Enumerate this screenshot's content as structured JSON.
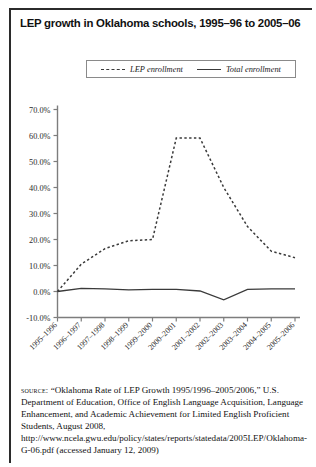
{
  "figure": {
    "title": "LEP growth in Oklahoma schools, 1995–96 to 2005–06",
    "source_label": "source:",
    "source_text": " “Oklahoma Rate of LEP Growth 1995/1996–2005/2006,” U.S. Department of Education, Office of English Language Acquisition, Language Enhancement, and Academic Achievement for Limited English Proficient Students, August 2008, http://www.ncela.gwu.edu/policy/states/reports/statedata/2005LEP/Oklahoma-G-06.pdf (accessed January 12, 2009)"
  },
  "legend": {
    "entries": [
      {
        "label": "LEP enrollment",
        "style": "dashed",
        "color": "#3a3a3a"
      },
      {
        "label": "Total enrollment",
        "style": "solid",
        "color": "#3a3a3a"
      }
    ]
  },
  "chart_data": {
    "type": "line",
    "title": "LEP growth in Oklahoma schools, 1995–96 to 2005–06",
    "xlabel": "",
    "ylabel": "",
    "categories": [
      "1995–1996",
      "1996–1997",
      "1997–1998",
      "1998–1999",
      "1999–2000",
      "2000–2001",
      "2001–2002",
      "2002–2003",
      "2003–2004",
      "2004–2005",
      "2005–2006"
    ],
    "ylim": [
      -10,
      70
    ],
    "yticks": [
      -10,
      0,
      10,
      20,
      30,
      40,
      50,
      60,
      70
    ],
    "ytick_labels": [
      "-10.0%",
      "0.0%",
      "10.0%",
      "20.0%",
      "30.0%",
      "40.0%",
      "50.0%",
      "60.0%",
      "70.0%"
    ],
    "grid": false,
    "legend_position": "top",
    "series": [
      {
        "name": "LEP enrollment",
        "style": "dashed",
        "color": "#3a3a3a",
        "values": [
          0.0,
          10.5,
          16.5,
          19.5,
          20.0,
          59.0,
          59.0,
          40.0,
          25.0,
          15.5,
          13.0
        ]
      },
      {
        "name": "Total enrollment",
        "style": "solid",
        "color": "#3a3a3a",
        "values": [
          0.0,
          1.2,
          1.0,
          0.6,
          0.8,
          0.8,
          0.2,
          -3.2,
          0.8,
          1.0,
          1.0
        ]
      }
    ]
  }
}
